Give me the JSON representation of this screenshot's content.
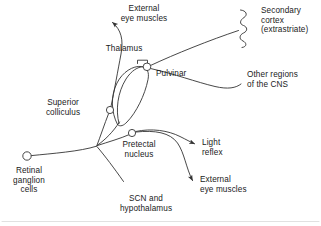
{
  "figure": {
    "type": "schematic-diagram",
    "line_color": "#333333",
    "text_color": "#1a1a1a",
    "background_color": "#ffffff"
  },
  "labels": {
    "external_eye_muscles_top": "External\neye muscles",
    "secondary_cortex": "Secondary\ncortex\n(extrastriate)",
    "thalamus": "Thalamus",
    "pulvinar": "Pulvinar",
    "other_regions_cns": "Other regions\nof the CNS",
    "superior_colliculus": "Superior\ncolliculus",
    "pretectal_nucleus": "Pretectal\nnucleus",
    "light_reflex": "Light\nreflex",
    "external_eye_muscles_bottom": "External\neye muscles",
    "retinal_ganglion_cells": "Retinal\nganglion\ncells",
    "scn_hypothalamus": "SCN and\nhypothalamus"
  },
  "nodes": [
    {
      "id": "retinal-ganglion-cells",
      "label": "Retinal ganglion cells",
      "shape": "circle",
      "x": 27,
      "y": 156,
      "r": 4.2
    },
    {
      "id": "optic-chiasm-junction",
      "label": "branch point",
      "shape": "junction",
      "x": 97,
      "y": 146
    },
    {
      "id": "superior-colliculus",
      "label": "Superior colliculus",
      "shape": "circle",
      "x": 110,
      "y": 110,
      "r": 3.6
    },
    {
      "id": "pretectal-nucleus",
      "label": "Pretectal nucleus",
      "shape": "circle",
      "x": 132,
      "y": 133,
      "r": 3.6
    },
    {
      "id": "pulvinar",
      "label": "Pulvinar",
      "shape": "circle",
      "x": 147,
      "y": 67,
      "r": 3.8
    },
    {
      "id": "thalamus-body",
      "label": "Thalamus",
      "shape": "oval-outline"
    },
    {
      "id": "secondary-cortex",
      "label": "Secondary cortex (extrastriate)",
      "shape": "wavy-line",
      "x": 243,
      "y": 28
    }
  ],
  "connections": [
    {
      "from": "retinal-ganglion-cells",
      "to": "optic-chiasm-junction",
      "arrow": false
    },
    {
      "from": "optic-chiasm-junction",
      "to": "superior-colliculus",
      "arrow": false
    },
    {
      "from": "optic-chiasm-junction",
      "to": "pretectal-nucleus",
      "arrow": false
    },
    {
      "from": "optic-chiasm-junction",
      "to": "thalamus-body",
      "arrow": false
    },
    {
      "from": "optic-chiasm-junction",
      "to": "scn-hypothalamus",
      "arrow": false
    },
    {
      "from": "superior-colliculus",
      "to": "external-eye-muscles-top",
      "arrow": true
    },
    {
      "from": "pulvinar",
      "to": "secondary-cortex",
      "arrow": false
    },
    {
      "from": "pulvinar",
      "to": "other-regions-cns",
      "arrow": false
    },
    {
      "from": "pretectal-nucleus",
      "to": "light-reflex",
      "arrow": true
    },
    {
      "from": "pretectal-nucleus",
      "to": "external-eye-muscles-bottom",
      "arrow": true
    }
  ]
}
